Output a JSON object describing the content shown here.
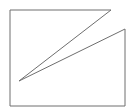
{
  "diagram": {
    "shape": "polygon",
    "stroke": "#6e6e6e",
    "fill": "none",
    "stroke_width": 1,
    "points": "10,10 111,10 19,81 125,29 125,106 10,106"
  }
}
